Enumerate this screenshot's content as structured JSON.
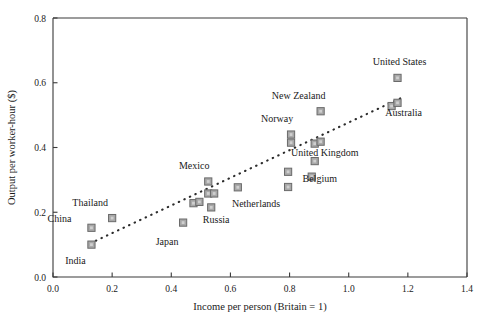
{
  "chart_data": {
    "type": "scatter",
    "title": "",
    "xlabel": "Income per person (Britain = 1)",
    "ylabel": "Output per worker-hour ($)",
    "xlim": [
      0.0,
      1.4
    ],
    "ylim": [
      0.0,
      0.8
    ],
    "xticks": [
      "0.0",
      "0.2",
      "0.4",
      "0.6",
      "0.8",
      "1.0",
      "1.2",
      "1.4"
    ],
    "xtick_values": [
      0.0,
      0.2,
      0.4,
      0.6,
      0.8,
      1.0,
      1.2,
      1.4
    ],
    "yticks": [
      "0.0",
      "0.2",
      "0.4",
      "0.6",
      "0.8"
    ],
    "ytick_values": [
      0.0,
      0.2,
      0.4,
      0.6,
      0.8
    ],
    "grid": false,
    "legend": "none",
    "marker": "gray-square",
    "points": [
      {
        "name": "India",
        "x": 0.13,
        "y": 0.1,
        "label": "India",
        "label_dx": -16,
        "label_dy": 19
      },
      {
        "name": "China",
        "x": 0.13,
        "y": 0.152,
        "label": "China",
        "label_dx": -32,
        "label_dy": -6
      },
      {
        "name": "Thailand",
        "x": 0.2,
        "y": 0.182,
        "label": "Thailand",
        "label_dx": -22,
        "label_dy": -12
      },
      {
        "name": "Japan",
        "x": 0.44,
        "y": 0.168,
        "label": "Japan",
        "label_dx": -16,
        "label_dy": 22
      },
      {
        "name": "unlabeled-1",
        "x": 0.475,
        "y": 0.228,
        "label": "",
        "label_dx": 0,
        "label_dy": 0
      },
      {
        "name": "unlabeled-2",
        "x": 0.495,
        "y": 0.232,
        "label": "",
        "label_dx": 0,
        "label_dy": 0
      },
      {
        "name": "Mexico",
        "x": 0.525,
        "y": 0.295,
        "label": "Mexico",
        "label_dx": -14,
        "label_dy": -12
      },
      {
        "name": "unlabeled-3",
        "x": 0.525,
        "y": 0.258,
        "label": "",
        "label_dx": 0,
        "label_dy": 0
      },
      {
        "name": "Russia",
        "x": 0.545,
        "y": 0.258,
        "label": "Russia",
        "label_dx": 2,
        "label_dy": 30
      },
      {
        "name": "unlabeled-4",
        "x": 0.535,
        "y": 0.215,
        "label": "",
        "label_dx": 0,
        "label_dy": 0
      },
      {
        "name": "unlabeled-5",
        "x": 0.625,
        "y": 0.277,
        "label": "",
        "label_dx": 0,
        "label_dy": 0
      },
      {
        "name": "unlabeled-6",
        "x": 0.795,
        "y": 0.325,
        "label": "",
        "label_dx": 0,
        "label_dy": 0
      },
      {
        "name": "Netherlands",
        "x": 0.795,
        "y": 0.278,
        "label": "Netherlands",
        "label_dx": -32,
        "label_dy": 20
      },
      {
        "name": "Norway-upper",
        "x": 0.805,
        "y": 0.44,
        "label": "Norway",
        "label_dx": -14,
        "label_dy": -13
      },
      {
        "name": "Norway-lower",
        "x": 0.805,
        "y": 0.415,
        "label": "",
        "label_dx": 0,
        "label_dy": 0
      },
      {
        "name": "Belgium",
        "x": 0.875,
        "y": 0.31,
        "label": "Belgium",
        "label_dx": 8,
        "label_dy": 5
      },
      {
        "name": "unlabeled-7",
        "x": 0.885,
        "y": 0.358,
        "label": "",
        "label_dx": 0,
        "label_dy": 0
      },
      {
        "name": "United Kingdom",
        "x": 0.885,
        "y": 0.412,
        "label": "United Kingdom",
        "label_dx": 10,
        "label_dy": 12
      },
      {
        "name": "unlabeled-8",
        "x": 0.905,
        "y": 0.418,
        "label": "",
        "label_dx": 0,
        "label_dy": 0
      },
      {
        "name": "New Zealand",
        "x": 0.905,
        "y": 0.512,
        "label": "New Zealand",
        "label_dx": -22,
        "label_dy": -12
      },
      {
        "name": "Australia",
        "x": 1.145,
        "y": 0.528,
        "label": "Australia",
        "label_dx": 12,
        "label_dy": 10
      },
      {
        "name": "Australia-pair",
        "x": 1.165,
        "y": 0.538,
        "label": "",
        "label_dx": 0,
        "label_dy": 0
      },
      {
        "name": "United States",
        "x": 1.165,
        "y": 0.615,
        "label": "United States",
        "label_dx": 2,
        "label_dy": -13
      }
    ],
    "trendline": {
      "x0": 0.145,
      "y0": 0.112,
      "x1": 1.175,
      "y1": 0.552
    }
  }
}
